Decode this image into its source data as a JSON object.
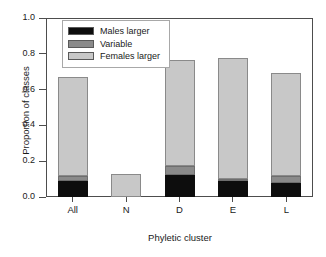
{
  "chart_data": {
    "type": "bar",
    "stacked": true,
    "title": "",
    "xlabel": "Phyletic cluster",
    "ylabel": "Proportion of classes",
    "categories": [
      "All",
      "N",
      "D",
      "E",
      "L"
    ],
    "ylim": [
      0.0,
      1.0
    ],
    "yticks": [
      "0.0",
      "0.2",
      "0.4",
      "0.6",
      "0.8",
      "1.0"
    ],
    "ytick_values": [
      0.0,
      0.2,
      0.4,
      0.6,
      0.8,
      1.0
    ],
    "grid": false,
    "legend_position": "top-left",
    "series": [
      {
        "name": "Males larger",
        "color": "#0d0d0d",
        "values": [
          0.09,
          0.0,
          0.125,
          0.095,
          0.08
        ]
      },
      {
        "name": "Variable",
        "color": "#8a8a8a",
        "values": [
          0.025,
          0.0,
          0.05,
          0.008,
          0.035
        ]
      },
      {
        "name": "Females larger",
        "color": "#c8c8c8",
        "values": [
          0.555,
          0.13,
          0.59,
          0.672,
          0.575
        ]
      }
    ],
    "totals": [
      0.67,
      0.13,
      0.765,
      0.775,
      0.69
    ]
  },
  "legend": {
    "items": [
      {
        "label": "Males larger",
        "color": "#0d0d0d"
      },
      {
        "label": "Variable",
        "color": "#8a8a8a"
      },
      {
        "label": "Females larger",
        "color": "#c8c8c8"
      }
    ]
  },
  "axes": {
    "y_title": "Proportion of classes",
    "x_title": "Phyletic cluster",
    "y_tick_labels": [
      "1.0",
      "0.8",
      "0.6",
      "0.4",
      "0.2",
      "0.0"
    ],
    "x_tick_labels": [
      "All",
      "N",
      "D",
      "E",
      "L"
    ]
  }
}
